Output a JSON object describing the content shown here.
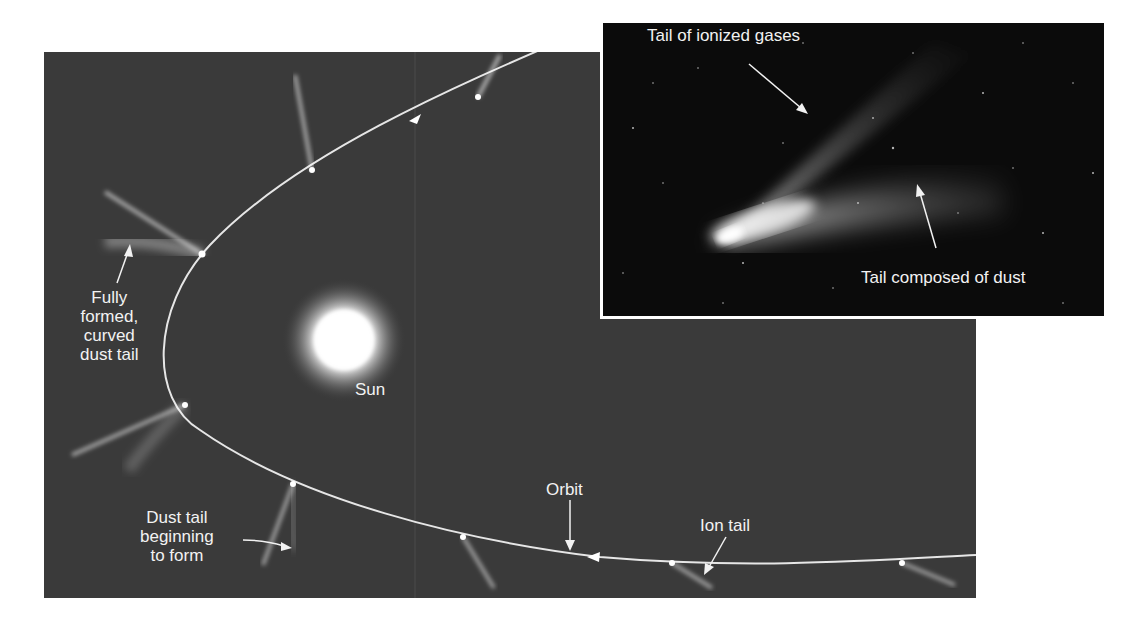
{
  "diagram": {
    "type": "comet orbit illustration",
    "colors": {
      "background": "#ffffff",
      "panel": "#3a3a3a",
      "inset_background": "#0b0b0b",
      "label_text": "#f2f2f2",
      "orbit_line": "#e6e6e6"
    },
    "main_panel": {
      "labels": {
        "fully_formed": [
          "Fully",
          "formed,",
          "curved",
          "dust tail"
        ],
        "sun": "Sun",
        "dust_tail_beginning": [
          "Dust tail",
          "beginning",
          "to form"
        ],
        "orbit": "Orbit",
        "ion_tail": "Ion tail"
      }
    },
    "inset_photo": {
      "labels": {
        "ionized_gases": "Tail of ionized gases",
        "dust": "Tail composed of dust"
      }
    }
  }
}
